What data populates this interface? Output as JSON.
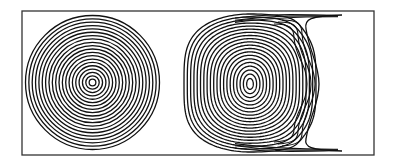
{
  "figure": {
    "width": 393,
    "height": 166,
    "background": "#ffffff",
    "stroke_color": "#111111",
    "frame": {
      "x": 22,
      "y": 11,
      "width": 352,
      "height": 144,
      "stroke": "#333333",
      "stroke_width": 1.3
    }
  },
  "panels": {
    "left": {
      "label": "concentric-circles",
      "center": [
        92.5,
        82.5
      ],
      "outer_radius": 67,
      "ring_count": 20,
      "stroke_width": 1.3
    },
    "right": {
      "label": "deformed-closed-streamlines-with-separatrix",
      "center": [
        250,
        84
      ],
      "ring_count": 20,
      "left_extent": 184,
      "right_extent": 316,
      "top_limit": 14,
      "bottom_limit": 152,
      "stroke_width": 1.3,
      "separatrix": {
        "top_end": [
          342,
          15
        ],
        "bottom_end": [
          342,
          151
        ],
        "neck_x": 306,
        "bulge_x": 319
      }
    }
  }
}
